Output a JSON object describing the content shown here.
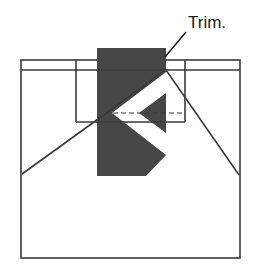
{
  "figure": {
    "background_color": "#ffffff",
    "line_color": "#3a3a3a",
    "shade_color": "#474747",
    "white_fill": "#ffffff",
    "text_color": "#1a1a1a"
  },
  "annotations": [
    {
      "name": "trim-label",
      "text": "Trim.",
      "x": 188,
      "y": 28,
      "leader": {
        "x1": 186,
        "y1": 32,
        "x2": 165,
        "y2": 57
      }
    }
  ],
  "geometry": {
    "outer_rect": {
      "x": 21,
      "y": 60,
      "width": 219,
      "height": 198
    },
    "upper_band_line": {
      "x1": 21,
      "y1": 70,
      "x2": 240,
      "y2": 70
    },
    "inner_rect": {
      "x": 76,
      "y": 60,
      "width": 109,
      "height": 62
    },
    "shaded_band": {
      "x": 97,
      "y": 48,
      "width": 69,
      "height": 128
    },
    "apex": {
      "x": 166,
      "y": 70
    },
    "left_ray_end": {
      "x": 22,
      "y": 174
    },
    "right_ray_end": {
      "x": 239,
      "y": 175
    },
    "arrow_apex": {
      "x": 112,
      "y": 113
    },
    "dashed_centerline": {
      "x1": 113,
      "y1": 113,
      "x2": 185,
      "y2": 113
    }
  }
}
